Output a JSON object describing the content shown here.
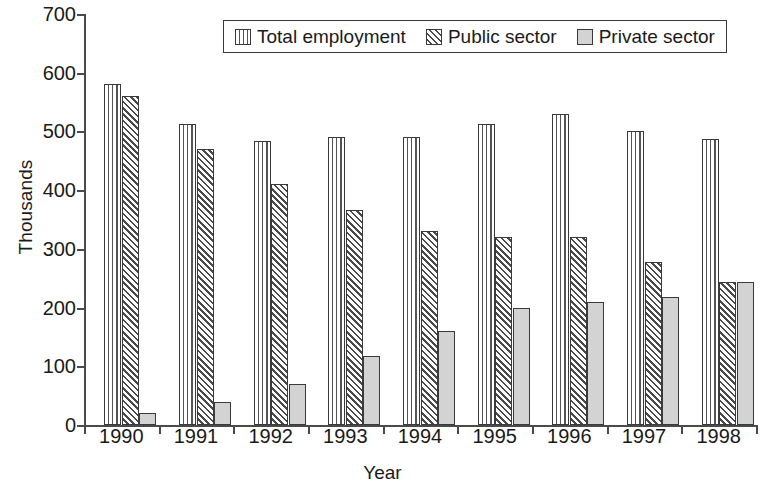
{
  "chart_data": {
    "type": "bar",
    "title": "",
    "xlabel": "Year",
    "ylabel": "Thousands",
    "categories": [
      "1990",
      "1991",
      "1992",
      "1993",
      "1994",
      "1995",
      "1996",
      "1997",
      "1998"
    ],
    "series": [
      {
        "name": "Total employment",
        "pattern": "vertical-lines",
        "color": "#ffffff",
        "values": [
          580,
          513,
          483,
          490,
          490,
          513,
          530,
          500,
          487
        ]
      },
      {
        "name": "Public sector",
        "pattern": "diagonal-hatch",
        "color": "#ffffff",
        "values": [
          560,
          470,
          410,
          367,
          330,
          320,
          320,
          278,
          243
        ]
      },
      {
        "name": "Private sector",
        "pattern": "solid-gray",
        "color": "#d3d3d3",
        "values": [
          20,
          40,
          70,
          118,
          160,
          200,
          210,
          218,
          243
        ]
      }
    ],
    "ylim": [
      0,
      700
    ],
    "yticks": [
      0,
      100,
      200,
      300,
      400,
      500,
      600,
      700
    ],
    "ytick_labels": [
      "0",
      "100",
      "200",
      "300",
      "400",
      "500",
      "600",
      "700"
    ],
    "grid": false,
    "legend_position": "top-center",
    "legend_entries": [
      "Total employment",
      "Public sector",
      "Private sector"
    ]
  }
}
